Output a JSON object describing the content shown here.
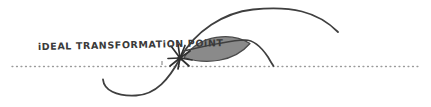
{
  "canvas": {
    "width": 431,
    "height": 107,
    "background_color": "#ffffff"
  },
  "colors": {
    "ink": "#3a3a3a",
    "curve_stroke": "#3f3f3f",
    "lens_fill": "#8a8a8a",
    "lens_stroke": "#454545",
    "baseline_dotted": "#9a9a9a",
    "label_text": "#3a3a3a"
  },
  "annotation": {
    "label": "iDEAL TRANSFORMATiON POiNT"
  },
  "baseline": {
    "name": "dotted-baseline",
    "y": 66,
    "x_start": 12,
    "x_end": 420,
    "style": "dotted"
  },
  "marker": {
    "name": "starburst-marker",
    "x": 180,
    "y": 58,
    "rays": 9
  },
  "shapes": {
    "lens": {
      "name": "shaded-lens",
      "left_tip_x": 184,
      "right_tip_x": 250,
      "center_y": 50,
      "max_height": 22
    },
    "s_curve": {
      "name": "s-curve-path",
      "start": [
        103,
        80
      ],
      "trough": [
        136,
        95
      ],
      "inflection": [
        180,
        58
      ],
      "peak": [
        300,
        10
      ],
      "end": [
        338,
        32
      ]
    },
    "crossing_curve": {
      "name": "crossing-curve-path",
      "start": [
        186,
        48
      ],
      "crossing": [
        249,
        43
      ],
      "end": [
        273,
        66
      ]
    }
  }
}
